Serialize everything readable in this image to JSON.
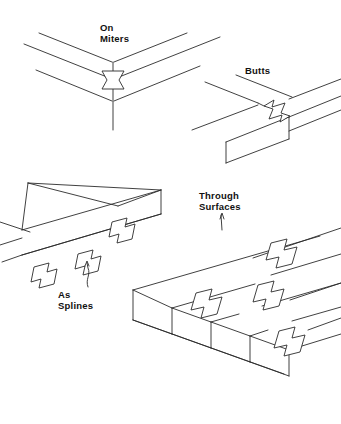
{
  "page": {
    "background_color": "#ffffff",
    "ink_color": "#2b2b2b",
    "width": 341,
    "height": 424
  },
  "labels": {
    "on_miters": {
      "line1": "On",
      "line2": "Miters"
    },
    "butts": {
      "line1": "Butts"
    },
    "through_surfaces": {
      "line1": "Through",
      "line2": "Surfaces"
    },
    "as_splines": {
      "line1": "As",
      "line2": "Splines"
    }
  },
  "figures": [
    {
      "id": "on-miters",
      "label": "On Miters",
      "description": "Mitered corner of two boards joined with a single butterfly key spanning the miter line",
      "key_count": 1
    },
    {
      "id": "butts",
      "label": "Butts",
      "description": "Butt joint of two boards with one butterfly key set across the joint on the top surface",
      "key_count": 1
    },
    {
      "id": "as-splines",
      "label": "As Splines",
      "description": "Butterfly keys used as splines inserted into the edge face of a board",
      "key_count": 3
    },
    {
      "id": "through-surfaces",
      "label": "Through Surfaces",
      "description": "Butterfly keys set through the top surface of a wide glued-up panel across multiple boards",
      "key_count": 4
    }
  ],
  "figure_count": 4,
  "total_keys": 9
}
